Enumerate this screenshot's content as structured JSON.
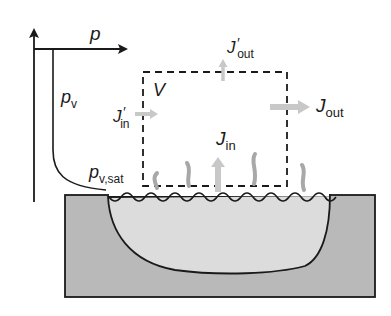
{
  "diagram": {
    "type": "evaporation control volume schematic",
    "axis": {
      "label": "p"
    },
    "curve_labels": {
      "pv": {
        "main": "p",
        "sub": "v"
      },
      "pv_sat": {
        "main": "p",
        "sub": "v,sat"
      }
    },
    "volume_label": "V",
    "fluxes": {
      "j_in_prime": {
        "main": "J",
        "prime": "′",
        "sub": "in"
      },
      "j_out_prime": {
        "main": "J",
        "prime": "′",
        "sub": "out"
      },
      "j_out": {
        "main": "J",
        "sub": "out"
      },
      "j_in": {
        "main": "J",
        "sub": "in"
      }
    },
    "colors": {
      "line": "#1a1a1a",
      "arrow_gray": "#c8c8c8",
      "vapor_gray": "#a8a8a8",
      "substrate": "#b9b9b9",
      "liquid": "#dcdcdc"
    }
  }
}
